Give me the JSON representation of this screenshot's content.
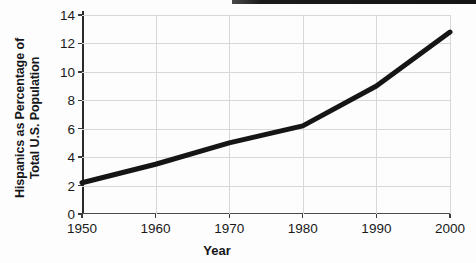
{
  "figure": {
    "background_color": "#fdfdfd",
    "scan_artifact": {
      "present": true,
      "color": "#141414"
    }
  },
  "chart_data": {
    "type": "line",
    "title": "",
    "subtitle": "",
    "xlabel": "Year",
    "ylabel_lines": [
      "Hispanics as Percentage of",
      "Total U.S. Population"
    ],
    "ylabel": "Hispanics as Percentage of Total U.S. Population",
    "x": [
      1950,
      1960,
      1970,
      1980,
      1990,
      2000
    ],
    "xtick_labels": [
      "1950",
      "1960",
      "1970",
      "1980",
      "1990",
      "2000"
    ],
    "ytick_labels": [
      "0",
      "2",
      "4",
      "6",
      "8",
      "10",
      "12",
      "14"
    ],
    "ytick_values": [
      0,
      2,
      4,
      6,
      8,
      10,
      12,
      14
    ],
    "values": [
      2.2,
      3.5,
      5.0,
      6.2,
      9.0,
      12.8
    ],
    "series": [
      {
        "name": "Hispanics as Percentage of Total U.S. Population",
        "values": [
          2.2,
          3.5,
          5.0,
          6.2,
          9.0,
          12.8
        ],
        "color": "#151515",
        "line_width": 5
      }
    ],
    "xlim": [
      1950,
      2000
    ],
    "ylim": [
      0,
      14
    ],
    "grid": true,
    "grid_color": "#d6d8dc",
    "legend": false,
    "legend_position": "none",
    "markers": false,
    "annotations": []
  }
}
